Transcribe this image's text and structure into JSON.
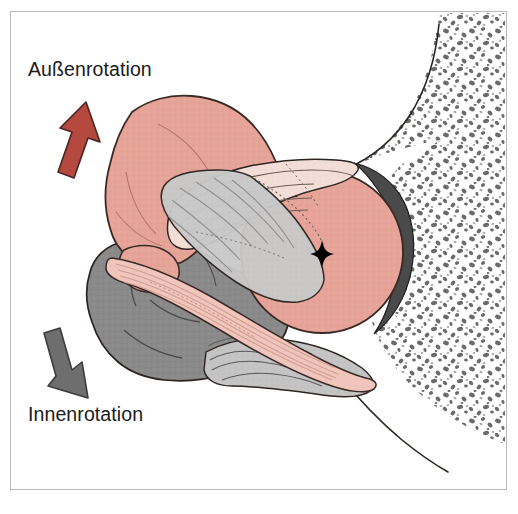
{
  "figure": {
    "name": "shoulder-rotation-anatomy",
    "kind": "anatomical-illustration",
    "title_visible": false,
    "background_color": "#ffffff",
    "frame": {
      "color": "#b9b9b9",
      "x": 10,
      "y": 11,
      "width": 497,
      "height": 479
    }
  },
  "labels": {
    "external_rotation": "Außenrotation",
    "internal_rotation": "Innenrotation"
  },
  "arrows": [
    {
      "id": "external-rotation-arrow",
      "label_ref": "Außenrotation",
      "direction": "up-right",
      "fill": "#b5483f",
      "stroke": "#4a2520",
      "tip": {
        "x": 88,
        "y": 104
      },
      "tail": {
        "x": 55,
        "y": 178
      }
    },
    {
      "id": "internal-rotation-arrow",
      "label_ref": "Innenrotation",
      "direction": "down-right",
      "fill": "#6e6e6e",
      "stroke": "#3c3c3c",
      "tip": {
        "x": 86,
        "y": 396
      },
      "tail": {
        "x": 52,
        "y": 329
      }
    }
  ],
  "colors": {
    "muscle_pink": "#e6a499",
    "muscle_pink_dark": "#dc9184",
    "tendon_pale": "#f3ded7",
    "ligament_gray": "#c9c9c9",
    "muscle_gray": "#8a8a8a",
    "cartilage_rim": "#4a4a4a",
    "bone_speckle": "#666666",
    "outline": "#2b2421",
    "text": "#1a1a1a"
  },
  "structures": [
    {
      "id": "humeral-head",
      "name": "humeral head",
      "fill": "#e6a499",
      "shape": "circle",
      "center": {
        "x": 322,
        "y": 252
      },
      "radius": 80
    },
    {
      "id": "center-of-rotation",
      "name": "center of rotation marker",
      "glyph": "four-pointed-star",
      "fill": "#000000",
      "x": 322,
      "y": 255,
      "size": 11
    },
    {
      "id": "cartilage-rim",
      "name": "articular cartilage rim",
      "fill": "#4a4a4a",
      "side": "posterior-right"
    },
    {
      "id": "supraspinatus-belly",
      "name": "upper muscle belly",
      "fill": "#e6a499"
    },
    {
      "id": "tendon-fibers-upper",
      "name": "wavy tendon fibers (upper)",
      "fill": "#f3ded7"
    },
    {
      "id": "subscapularis-mass",
      "name": "gray muscle mass (lower left)",
      "fill": "#8a8a8a"
    },
    {
      "id": "ligament-band",
      "name": "diagonal ligament band",
      "fill": "#c9c9c9"
    },
    {
      "id": "biceps-tendon-band",
      "name": "pale pink tendon band",
      "fill": "#f0c6bc"
    },
    {
      "id": "tendon-fibers-lower",
      "name": "wavy tendon fibers (lower)",
      "fill": "#c0c0c0"
    },
    {
      "id": "scapula-neck",
      "name": "scapular neck / glenoid bone",
      "fill": "#ffffff",
      "texture": "trabecular-speckle"
    }
  ],
  "bone_texture": {
    "name": "trabecular-bone-speckle",
    "speckle_color": "#6b6b6b",
    "region": "right side of figure, above and below glenoid"
  }
}
